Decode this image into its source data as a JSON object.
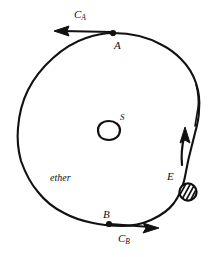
{
  "figure": {
    "background_color": "#ffffff",
    "ink_color": "#111111",
    "labels": {
      "c_a": {
        "base": "C",
        "sub": "A"
      },
      "point_a": "A",
      "source_s": "S",
      "medium": "ether",
      "emitter_e": "E",
      "point_b": "B",
      "c_b": {
        "base": "C",
        "sub": "B"
      }
    },
    "elements": [
      {
        "name": "ether-ring",
        "kind": "hand-drawn-circle"
      },
      {
        "name": "source-blob",
        "kind": "hand-drawn-blob"
      },
      {
        "name": "point-a-dot",
        "kind": "filled-dot"
      },
      {
        "name": "point-b-dot",
        "kind": "filled-dot"
      },
      {
        "name": "emitter-hatched-circle",
        "kind": "hatched-circle"
      },
      {
        "name": "c-a-arrow",
        "kind": "arrow",
        "direction": "left"
      },
      {
        "name": "c-b-arrow",
        "kind": "arrow",
        "direction": "right"
      },
      {
        "name": "rotation-arrow",
        "kind": "arrow",
        "direction": "up"
      }
    ]
  }
}
